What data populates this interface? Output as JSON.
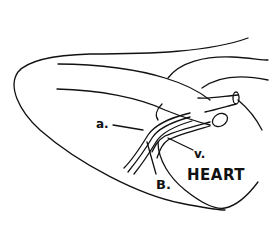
{
  "diagram": {
    "type": "anatomical line drawing",
    "colors": {
      "line": "#111111",
      "background": "#ffffff"
    },
    "labels": {
      "artery": "a.",
      "vein": "v.",
      "bundle": "B.",
      "heart": "HEART"
    }
  }
}
